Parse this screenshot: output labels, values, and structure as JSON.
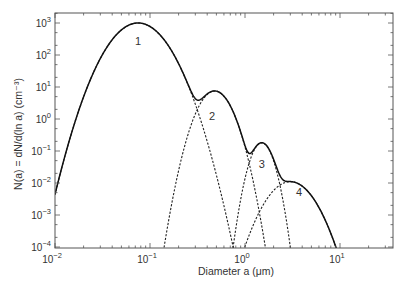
{
  "chart_data": {
    "type": "line",
    "title": "",
    "xlabel": "Diameter a (μm)",
    "ylabel": "N(a) = dN/d(ln a) (cm⁻³)",
    "xscale": "log",
    "yscale": "log",
    "xlim": [
      0.01,
      36
    ],
    "ylim": [
      0.0001,
      2000
    ],
    "x_ticks": [
      "10⁻²",
      "10⁻¹",
      "10⁰",
      "10¹"
    ],
    "x_tick_values": [
      0.01,
      0.1,
      1,
      10
    ],
    "y_ticks": [
      "10⁻⁴",
      "10⁻³",
      "10⁻²",
      "10⁻¹",
      "10⁰",
      "10¹",
      "10²",
      "10³"
    ],
    "y_tick_values": [
      0.0001,
      0.001,
      0.01,
      0.1,
      1,
      10,
      100,
      1000
    ],
    "grid": false,
    "legend": "none",
    "series": [
      {
        "name": "Total (sum of modes)",
        "style": "solid",
        "peaks": [
          {
            "a": 0.075,
            "N": 1000
          },
          {
            "a": 0.48,
            "N": 7.5
          },
          {
            "a": 1.5,
            "N": 0.18
          },
          {
            "a": 3.0,
            "N": 0.011
          }
        ]
      },
      {
        "name": "1",
        "style": "dashed",
        "mode_diameter": 0.075,
        "peak_N": 1000,
        "curvature": 7.0
      },
      {
        "name": "2",
        "style": "dashed",
        "mode_diameter": 0.48,
        "peak_N": 7.5,
        "curvature": 17.2
      },
      {
        "name": "3",
        "style": "dashed",
        "mode_diameter": 1.5,
        "peak_N": 0.18,
        "curvature": 36
      },
      {
        "name": "4",
        "style": "dashed",
        "mode_diameter": 3.0,
        "peak_N": 0.011,
        "curvature": 8.9
      }
    ],
    "annotations": [
      {
        "text": "1",
        "a": 0.075,
        "N": 200
      },
      {
        "text": "2",
        "a": 0.45,
        "N": 0.9
      },
      {
        "text": "3",
        "a": 1.5,
        "N": 0.03
      },
      {
        "text": "4",
        "a": 3.7,
        "N": 0.004
      }
    ]
  },
  "labels": {
    "x_axis_title": "Diameter a (μm)",
    "y_axis_title": "N(a) = dN/d(ln a) (cm⁻³)"
  }
}
